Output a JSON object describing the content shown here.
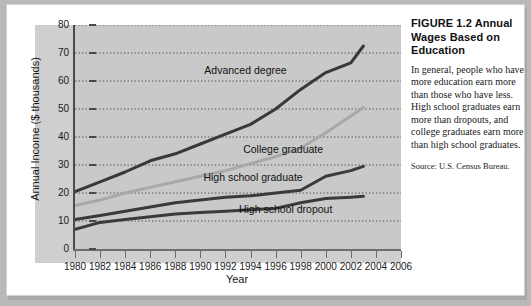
{
  "figure": {
    "caption_title": "FIGURE 1.2  Annual Wages Based on Education",
    "caption_body": "In general, people who have more education earn more than those who have less. High school graduates earn more than dropouts, and college graduates earn more than high school graduates.",
    "caption_source": "Source: U.S. Census Bureau."
  },
  "chart_data": {
    "type": "line",
    "title": "",
    "xlabel": "Year",
    "ylabel": "Annual Income ($ thousands)",
    "xlim": [
      1980,
      2006
    ],
    "ylim": [
      0,
      80
    ],
    "ytick_values": [
      0,
      10,
      20,
      30,
      40,
      50,
      60,
      70,
      80
    ],
    "xtick_values": [
      1980,
      1982,
      1984,
      1986,
      1988,
      1990,
      1992,
      1994,
      1996,
      1998,
      2000,
      2002,
      2004,
      2006
    ],
    "grid": true,
    "legend_position": "inline-labels",
    "x": [
      1980,
      1982,
      1984,
      1986,
      1988,
      1990,
      1992,
      1994,
      1996,
      1998,
      2000,
      2002,
      2003
    ],
    "series": [
      {
        "name": "Advanced degree",
        "color": "#383838",
        "width": 3.0,
        "label_x": 1993.6,
        "label_y": 63.5,
        "values": [
          20.5,
          24.0,
          27.5,
          31.5,
          34.0,
          37.5,
          41.0,
          44.5,
          50.0,
          57.0,
          63.0,
          66.5,
          72.5
        ]
      },
      {
        "name": "College graduate",
        "color": "#a8a8a8",
        "width": 3.0,
        "label_x": 1996.6,
        "label_y": 35.5,
        "values": [
          15.5,
          17.5,
          20.0,
          22.0,
          24.0,
          26.0,
          28.0,
          30.5,
          33.0,
          36.0,
          41.5,
          47.5,
          50.5
        ]
      },
      {
        "name": "High school graduate",
        "color": "#3a3a3a",
        "width": 3.0,
        "label_x": 1994.2,
        "label_y": 25.5,
        "values": [
          10.5,
          12.0,
          13.5,
          15.0,
          16.5,
          17.5,
          18.5,
          19.0,
          20.0,
          21.0,
          26.0,
          28.0,
          29.5
        ]
      },
      {
        "name": "High school dropout",
        "color": "#3a3a3a",
        "width": 3.0,
        "label_x": 1996.8,
        "label_y": 14.0,
        "values": [
          7.0,
          9.5,
          10.5,
          11.5,
          12.5,
          13.0,
          13.5,
          14.0,
          14.5,
          16.5,
          18.0,
          18.5,
          18.8
        ]
      }
    ]
  }
}
